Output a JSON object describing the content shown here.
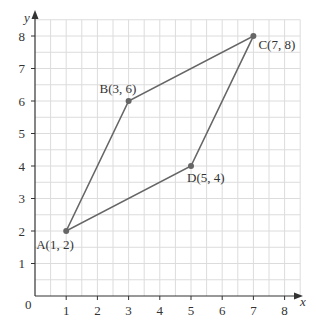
{
  "chart_data": {
    "type": "scatter",
    "title": "",
    "xlabel": "x",
    "ylabel": "y",
    "origin_label": "0",
    "xlim": [
      0,
      8.5
    ],
    "ylim": [
      0,
      8.5
    ],
    "x_ticks": [
      "1",
      "2",
      "3",
      "4",
      "5",
      "6",
      "7",
      "8"
    ],
    "y_ticks": [
      "1",
      "2",
      "3",
      "4",
      "5",
      "6",
      "7",
      "8"
    ],
    "grid": true,
    "points": [
      {
        "name": "A",
        "x": 1,
        "y": 2,
        "label": "A(1, 2)"
      },
      {
        "name": "B",
        "x": 3,
        "y": 6,
        "label": "B(3, 6)"
      },
      {
        "name": "C",
        "x": 7,
        "y": 8,
        "label": "C(7, 8)"
      },
      {
        "name": "D",
        "x": 5,
        "y": 4,
        "label": "D(5, 4)"
      }
    ],
    "polygon": [
      "A",
      "B",
      "C",
      "D"
    ],
    "colors": {
      "grid": "#dcdcdc",
      "line": "#666666",
      "point": "#666666",
      "axis": "#333333"
    }
  }
}
